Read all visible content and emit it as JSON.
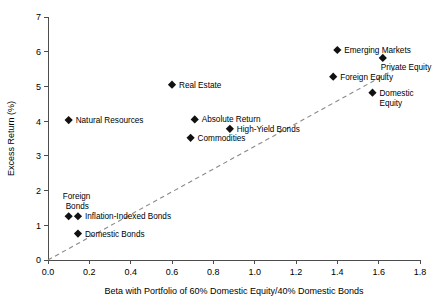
{
  "chart_data": {
    "type": "scatter",
    "title": "",
    "xlabel": "Beta with Portfolio of 60% Domestic Equity/40% Domestic Bonds",
    "ylabel": "Excess Return (%)",
    "xlim": [
      0.0,
      1.8
    ],
    "ylim": [
      0,
      7
    ],
    "xticks": [
      "0.0",
      "0.2",
      "0.4",
      "0.6",
      "0.8",
      "1.0",
      "1.2",
      "1.4",
      "1.6",
      "1.8"
    ],
    "xtick_values": [
      0.0,
      0.2,
      0.4,
      0.6,
      0.8,
      1.0,
      1.2,
      1.4,
      1.6,
      1.8
    ],
    "yticks": [
      "0",
      "1",
      "2",
      "3",
      "4",
      "5",
      "6",
      "7"
    ],
    "ytick_values": [
      0,
      1,
      2,
      3,
      4,
      5,
      6,
      7
    ],
    "grid": false,
    "legend": "none",
    "marker_style": "filled-diamond",
    "marker_color": "#111111",
    "trendline": {
      "style": "dashed",
      "color": "#8a8a8a",
      "x0": 0.0,
      "y0": 0.0,
      "x1": 1.68,
      "y1": 5.5
    },
    "points": [
      {
        "label": "Emerging Markets",
        "x": 1.4,
        "y": 6.05,
        "label_pos": "right"
      },
      {
        "label": "Private Equity",
        "x": 1.62,
        "y": 5.82,
        "label_pos": "below-left"
      },
      {
        "label": "Foreign Equity",
        "x": 1.38,
        "y": 5.28,
        "label_pos": "right"
      },
      {
        "label": "Domestic Equity",
        "x": 1.57,
        "y": 4.82,
        "label_pos": "right-wrap"
      },
      {
        "label": "Real Estate",
        "x": 0.6,
        "y": 5.05,
        "label_pos": "right"
      },
      {
        "label": "Natural Resources",
        "x": 0.1,
        "y": 4.03,
        "label_pos": "right"
      },
      {
        "label": "Absolute Return",
        "x": 0.71,
        "y": 4.05,
        "label_pos": "right"
      },
      {
        "label": "High-Yield Bonds",
        "x": 0.88,
        "y": 3.78,
        "label_pos": "right"
      },
      {
        "label": "Commodities",
        "x": 0.69,
        "y": 3.52,
        "label_pos": "right"
      },
      {
        "label": "Foreign Bonds",
        "x": 0.1,
        "y": 1.26,
        "label_pos": "above-wrap"
      },
      {
        "label": "Inflation-Indexed Bonds",
        "x": 0.145,
        "y": 1.26,
        "label_pos": "right"
      },
      {
        "label": "Domestic Bonds",
        "x": 0.145,
        "y": 0.76,
        "label_pos": "right"
      }
    ]
  }
}
